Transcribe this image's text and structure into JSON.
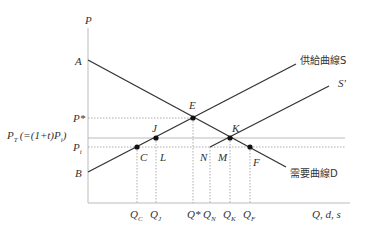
{
  "axes": {
    "y_label": "P",
    "x_label": "Q, d, s"
  },
  "curves": {
    "supply_label": "供給曲線S",
    "supply_shifted_label": "S′",
    "demand_label": "需要曲線D"
  },
  "points": {
    "A": "A",
    "B": "B",
    "C": "C",
    "E": "E",
    "F": "F",
    "J": "J",
    "K": "K",
    "L": "L",
    "M": "M",
    "N": "N"
  },
  "y_ticks": {
    "p_star": "P*",
    "p_t_main": "P",
    "p_t_sub": "T",
    "p_t_expr": "(=(1+t)P",
    "p_t_expr_sub": "i",
    "p_t_close": ")",
    "p_i_main": "P",
    "p_i_sub": "i"
  },
  "x_ticks": [
    {
      "main": "Q",
      "sub": "C"
    },
    {
      "main": "Q",
      "sub": "J"
    },
    {
      "main": "Q*",
      "sub": ""
    },
    {
      "main": "Q",
      "sub": "N"
    },
    {
      "main": "Q",
      "sub": "K"
    },
    {
      "main": "Q",
      "sub": "F"
    }
  ],
  "colors": {
    "line": "#333333",
    "guide": "#999999"
  }
}
